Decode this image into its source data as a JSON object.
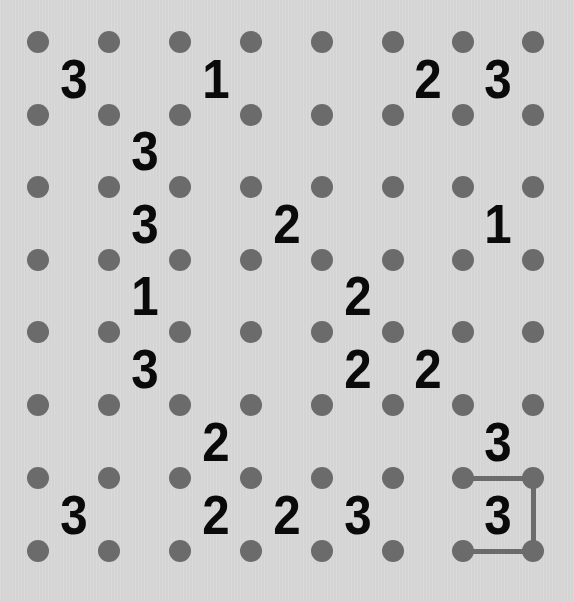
{
  "puzzle": {
    "type": "slitherlink",
    "dot_rows": 8,
    "dot_cols": 8,
    "cell_rows": 7,
    "cell_cols": 7,
    "colors": {
      "background": "#d8d8d8",
      "dot": "#6b6b6b",
      "line": "#6b6b6b",
      "clue": "#0a0a0a"
    },
    "grid": [
      [
        "3",
        "",
        "1",
        "",
        "",
        "2",
        "3"
      ],
      [
        "",
        "3",
        "",
        "",
        "",
        "",
        ""
      ],
      [
        "",
        "3",
        "",
        "2",
        "",
        "",
        "1"
      ],
      [
        "",
        "1",
        "",
        "",
        "2",
        "",
        ""
      ],
      [
        "",
        "3",
        "",
        "",
        "2",
        "2",
        ""
      ],
      [
        "",
        "",
        "2",
        "",
        "",
        "",
        "3"
      ],
      [
        "3",
        "",
        "2",
        "2",
        "3",
        "",
        "3"
      ]
    ],
    "drawn_edges": [
      {
        "orientation": "h",
        "row": 6,
        "col": 6,
        "label": "top of cell r6c6"
      },
      {
        "orientation": "v",
        "row": 6,
        "col": 7,
        "label": "right of cell r6c6"
      },
      {
        "orientation": "h",
        "row": 7,
        "col": 6,
        "label": "bottom of cell r6c6"
      }
    ]
  }
}
